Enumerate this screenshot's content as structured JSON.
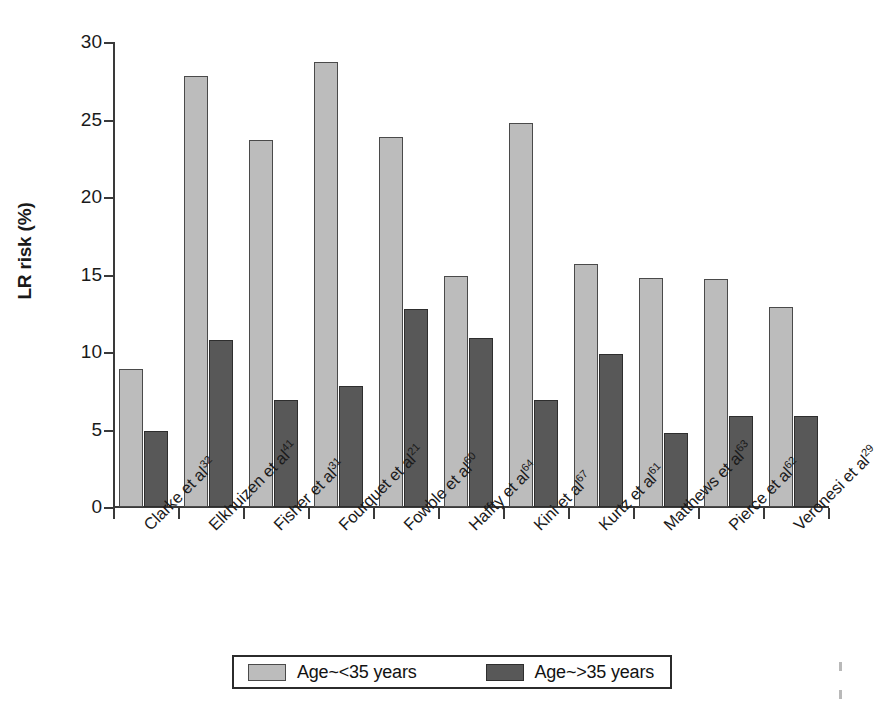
{
  "chart_data": {
    "type": "bar",
    "title": "",
    "xlabel": "",
    "ylabel": "LR risk (%)",
    "ylim": [
      0,
      30
    ],
    "yticks": [
      0,
      5,
      10,
      15,
      20,
      25,
      30
    ],
    "ytick_labels": [
      "0",
      "5",
      "10",
      "15",
      "20",
      "25",
      "30"
    ],
    "grid": false,
    "legend_position": "bottom-center",
    "categories": [
      "Clarke et al32",
      "Elkhuizen et al41",
      "Fisher et al31",
      "Fourquet et al21",
      "Fowble et al60",
      "Haffty et al64",
      "Kini et al67",
      "Kurtz et al61",
      "Matthews et al63",
      "Pierce et al62",
      "Veronesi et al29"
    ],
    "category_parts": [
      {
        "name": "Clarke et al",
        "ref": "32"
      },
      {
        "name": "Elkhuizen et al",
        "ref": "41"
      },
      {
        "name": "Fisher et al",
        "ref": "31"
      },
      {
        "name": "Fourquet et al",
        "ref": "21"
      },
      {
        "name": "Fowble et al",
        "ref": "60"
      },
      {
        "name": "Haffty et al",
        "ref": "64"
      },
      {
        "name": "Kini et al",
        "ref": "67"
      },
      {
        "name": "Kurtz et al",
        "ref": "61"
      },
      {
        "name": "Matthews et al",
        "ref": "63"
      },
      {
        "name": "Pierce et al",
        "ref": "62"
      },
      {
        "name": "Veronesi et al",
        "ref": "29"
      }
    ],
    "series": [
      {
        "name": "Age~<35 years",
        "color": "#bcbcbc",
        "values": [
          8.9,
          27.8,
          23.7,
          28.7,
          23.9,
          14.9,
          24.8,
          15.7,
          14.8,
          14.7,
          12.9
        ]
      },
      {
        "name": "Age~>35 years",
        "color": "#585858",
        "values": [
          4.9,
          10.8,
          6.9,
          7.8,
          12.8,
          10.9,
          6.9,
          9.9,
          4.8,
          5.9,
          5.9
        ]
      }
    ]
  },
  "legend": {
    "entries": [
      {
        "label": "Age~<35 years",
        "swatch": "light"
      },
      {
        "label": "Age~>35 years",
        "swatch": "dark"
      }
    ]
  },
  "colors": {
    "light_bar": "#bcbcbc",
    "dark_bar": "#585858",
    "axis": "#3a3a3a",
    "text": "#1a1a1a",
    "background": "#ffffff"
  }
}
